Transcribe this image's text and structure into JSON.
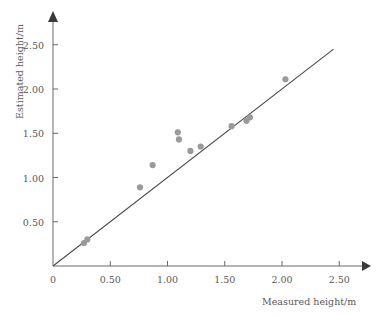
{
  "chart_data": {
    "type": "scatter",
    "title": "",
    "xlabel": "Measured height/m",
    "ylabel": "Estimated height/m",
    "xlim": [
      0,
      2.75
    ],
    "ylim": [
      0,
      2.75
    ],
    "xticks": [
      0,
      0.5,
      1.0,
      1.5,
      2.0,
      2.5
    ],
    "xtick_labels": [
      "0",
      "0.50",
      "1.00",
      "1.50",
      "2.00",
      "2.50"
    ],
    "yticks": [
      0.5,
      1.0,
      1.5,
      2.0,
      2.5
    ],
    "ytick_labels": [
      "0.50",
      "1.00",
      "1.50",
      "2.00",
      "2.50"
    ],
    "grid": false,
    "legend": "none",
    "marker_color": "#9a9a9a",
    "line_color": "#4a4a4a",
    "axis_color": "#6a6a6a",
    "reference_line": {
      "label": "y = x",
      "x": [
        0.0,
        2.45
      ],
      "y": [
        0.0,
        2.45
      ]
    },
    "points": [
      {
        "x": 0.27,
        "y": 0.26
      },
      {
        "x": 0.3,
        "y": 0.3
      },
      {
        "x": 0.76,
        "y": 0.89
      },
      {
        "x": 0.87,
        "y": 1.14
      },
      {
        "x": 1.09,
        "y": 1.51
      },
      {
        "x": 1.1,
        "y": 1.43
      },
      {
        "x": 1.2,
        "y": 1.3
      },
      {
        "x": 1.29,
        "y": 1.35
      },
      {
        "x": 1.56,
        "y": 1.58
      },
      {
        "x": 1.69,
        "y": 1.64
      },
      {
        "x": 1.72,
        "y": 1.68
      },
      {
        "x": 2.03,
        "y": 2.11
      }
    ]
  }
}
